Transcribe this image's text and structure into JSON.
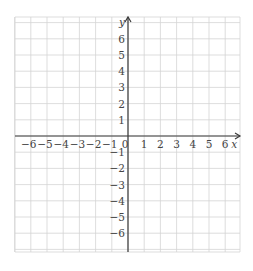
{
  "chart_data": {
    "type": "scatter",
    "title": "",
    "xlabel": "x",
    "ylabel": "y",
    "xlim": [
      -6.5,
      6.5
    ],
    "ylim": [
      -7,
      7.5
    ],
    "grid": true,
    "x_ticks": [
      -6,
      -5,
      -4,
      -3,
      -2,
      -1,
      0,
      1,
      2,
      3,
      4,
      5,
      6
    ],
    "y_ticks": [
      -6,
      -5,
      -4,
      -3,
      -2,
      -1,
      1,
      2,
      3,
      4,
      5,
      6
    ],
    "x_tick_labels": [
      "−6",
      "−5",
      "−4",
      "−3",
      "−2",
      "−1",
      "0",
      "1",
      "2",
      "3",
      "4",
      "5",
      "6"
    ],
    "y_tick_labels": [
      "−6",
      "−5",
      "−4",
      "−3",
      "−2",
      "−1",
      "1",
      "2",
      "3",
      "4",
      "5",
      "6"
    ],
    "series": [],
    "colors": {
      "grid": "#d4d4d4",
      "axis": "#3a3a3a",
      "text": "#444444"
    }
  }
}
